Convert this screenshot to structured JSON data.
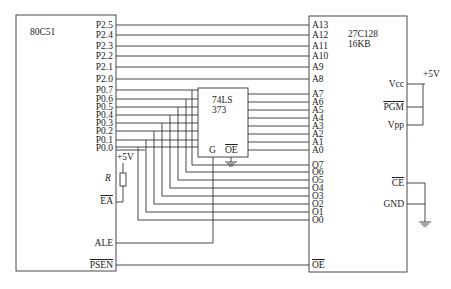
{
  "mcu": {
    "name": "80C51",
    "pins_p2": [
      "P2.5",
      "P2.4",
      "P2.3",
      "P2.2",
      "P2.1",
      "P2.0"
    ],
    "pins_p0": [
      "P0.7",
      "P0.6",
      "P0.5",
      "P0.4",
      "P0.3",
      "P0.2",
      "P0.1",
      "P0.0"
    ],
    "ea": "EA",
    "ale": "ALE",
    "psen": "PSEN",
    "resistor": "R",
    "supply": "+5V"
  },
  "latch": {
    "name_line1": "74LS",
    "name_line2": "373",
    "g": "G",
    "oe": "OE"
  },
  "eprom": {
    "name_line1": "27C128",
    "name_line2": "16KB",
    "addr_high": [
      "A13",
      "A12",
      "A11",
      "A10",
      "A9",
      "A8"
    ],
    "addr_low": [
      "A7",
      "A6",
      "A5",
      "A4",
      "A3",
      "A2",
      "A1",
      "A0"
    ],
    "data": [
      "O7",
      "O6",
      "O5",
      "O4",
      "O3",
      "O2",
      "O1",
      "O0"
    ],
    "oe": "OE",
    "vcc": "Vcc",
    "pgm": "PGM",
    "vpp": "Vpp",
    "ce": "CE",
    "gnd": "GND",
    "supply": "+5V"
  }
}
